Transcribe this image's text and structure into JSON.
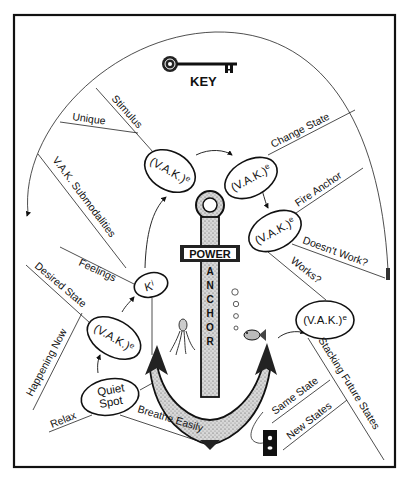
{
  "title": "KEY",
  "anchor": {
    "crossbar": "POWER",
    "shank": [
      "A",
      "N",
      "C",
      "H",
      "O",
      "R"
    ]
  },
  "colors": {
    "ink": "#111111",
    "background": "#ffffff",
    "stipple": "#9a9a9a"
  },
  "nodes": {
    "top_left": {
      "label": "(V.A.K.)",
      "sup": "e"
    },
    "top_right": {
      "label": "(V.A.K.)",
      "sup": "e"
    },
    "fire": {
      "label": "(V.A.K.)",
      "sup": "e"
    },
    "ki": {
      "label": "K",
      "sup": "i"
    },
    "desired": {
      "label": "(V.A.K.)",
      "sup": "e"
    },
    "future": {
      "label": "(V.A.K.)",
      "sup": "e"
    },
    "quiet": {
      "line1": "Quiet",
      "line2": "Spot"
    }
  },
  "branches": {
    "unique": "Unique",
    "stimulus": "Stimulus",
    "change_state": "Change State",
    "fire_anchor": "Fire Anchor",
    "doesnt_work": "Doesn't Work?",
    "works": "Works?",
    "vak_submodalities": "V.A.K. Submodalities",
    "feelings": "Feelings",
    "desired_state": "Desired State",
    "happening_now": "Happening Now",
    "relax": "Relax",
    "breathe_easily": "Breathe Easily",
    "stacking_future_states": "Stacking Future States",
    "same_state": "Same State",
    "new_states": "New States"
  },
  "icons": [
    "key-icon",
    "anchor-icon",
    "octopus-icon",
    "fish-icon",
    "bubbles-icon",
    "plug-socket-icon"
  ]
}
